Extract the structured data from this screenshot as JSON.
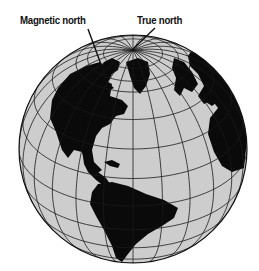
{
  "labels": {
    "magnetic_north": "Magnetic north",
    "true_north": "True north"
  },
  "label_positions": {
    "magnetic_north": {
      "x": 20,
      "y": 14
    },
    "true_north": {
      "x": 137,
      "y": 14
    }
  },
  "pointers": [
    {
      "name": "magnetic-north-pointer",
      "x1": 88,
      "y1": 29,
      "x2": 106,
      "y2": 78
    },
    {
      "name": "true-north-pointer",
      "x1": 155,
      "y1": 28,
      "x2": 132,
      "y2": 50
    }
  ],
  "globe": {
    "cx": 133,
    "cy": 149,
    "r": 114,
    "center_lat": 30,
    "center_lon": -45,
    "ocean_color": "#cdcdcd",
    "land_color": "#0a0a0a",
    "grid_color": "#1a1a1a",
    "graticule_step_deg": 15,
    "polar_circle_lat": 66.5
  },
  "continents": [
    {
      "name": "north-america",
      "d": "M58 88 L70 74 L86 66 L100 62 L108 70 L104 80 L112 84 L110 96 L122 100 L128 106 L124 114 L116 116 L110 124 L102 128 L96 136 L92 150 L94 162 L102 170 L96 174 L86 166 L82 152 L74 150 L68 158 L62 150 L56 132 L50 118 L52 100 Z"
    },
    {
      "name": "central-america",
      "d": "M82 150 L92 160 L98 172 L106 178 L110 184 L104 186 L96 180 L88 172 L84 164 Z"
    },
    {
      "name": "cuba",
      "d": "M104 162 L112 160 L120 164 L118 168 L110 166 Z"
    },
    {
      "name": "south-america",
      "d": "M98 184 L112 182 L128 186 L146 194 L164 200 L178 208 L174 218 L162 226 L148 234 L136 244 L128 254 L122 262 L116 258 L112 246 L104 230 L96 216 L90 204 L92 192 Z"
    },
    {
      "name": "greenland",
      "d": "M126 62 L138 58 L148 62 L150 74 L146 86 L140 94 L134 88 L130 76 Z"
    },
    {
      "name": "arctic-islands",
      "d": "M104 62 L112 58 L120 62 L118 70 L112 74 L108 82 L114 88 L106 92 L100 84 L98 72 Z"
    },
    {
      "name": "scandinavia",
      "d": "M174 58 L184 62 L192 72 L198 84 L192 92 L184 88 L180 96 L174 90 L176 78 L172 68 Z"
    },
    {
      "name": "europe-africa",
      "d": "M196 44 L214 54 L230 70 L240 88 L246 110 L247 140 L244 168 L232 172 L222 166 L214 152 L208 134 L210 118 L218 108 L212 100 L204 104 L198 96 L204 86 L198 74 L190 66 L188 56 Z"
    },
    {
      "name": "iberia",
      "d": "M206 94 L216 90 L220 100 L212 106 L206 102 Z"
    }
  ]
}
